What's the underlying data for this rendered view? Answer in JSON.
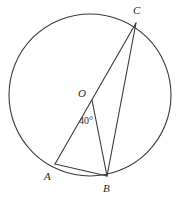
{
  "figure": {
    "kind": "circle-geometry-diagram",
    "background_color": "#ffffff",
    "stroke_color": "#3a3a3a",
    "text_color": "#2b2b2b",
    "width": 183,
    "height": 198
  },
  "labels": {
    "center": "O",
    "point_a": "A",
    "point_b": "B",
    "point_c": "C",
    "angle_value": "40°"
  },
  "chart_data": {
    "type": "diagram",
    "title": "",
    "circle": {
      "center": {
        "x": 90,
        "y": 95
      },
      "radius": 81
    },
    "points": [
      {
        "name": "O",
        "x": 92,
        "y": 100,
        "on_circle": false,
        "role": "center"
      },
      {
        "name": "A",
        "x": 55,
        "y": 164,
        "on_circle": true,
        "role": "vertex"
      },
      {
        "name": "B",
        "x": 107,
        "y": 176,
        "on_circle": true,
        "role": "vertex"
      },
      {
        "name": "C",
        "x": 136,
        "y": 23,
        "on_circle": true,
        "role": "vertex"
      }
    ],
    "segments": [
      {
        "name": "CA",
        "from": "C",
        "to": "A",
        "through_center": true
      },
      {
        "name": "CB",
        "from": "C",
        "to": "B",
        "through_center": false
      },
      {
        "name": "OB",
        "from": "O",
        "to": "B",
        "through_center": false
      },
      {
        "name": "AB",
        "from": "A",
        "to": "B",
        "through_center": false
      }
    ],
    "angles": [
      {
        "name": "AOB-supplement",
        "vertex": "O",
        "rays": [
          "A",
          "B"
        ],
        "value": 40,
        "unit": "degrees",
        "label": "40°"
      }
    ]
  }
}
